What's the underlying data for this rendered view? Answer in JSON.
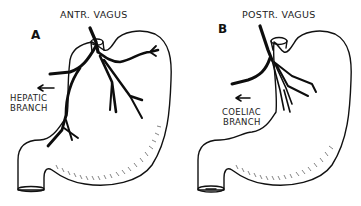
{
  "figure": {
    "panels": [
      {
        "letter": "A",
        "title": "ANTR. VAGUS",
        "branch_label_line1": "HEPATIC",
        "branch_label_line2": "BRANCH",
        "arrow_direction": "left"
      },
      {
        "letter": "B",
        "title": "POSTR. VAGUS",
        "branch_label_line1": "COELIAC",
        "branch_label_line2": "BRANCH",
        "arrow_direction": "left"
      }
    ],
    "colors": {
      "background": "#ffffff",
      "line": "#111111",
      "text": "#222222"
    }
  }
}
